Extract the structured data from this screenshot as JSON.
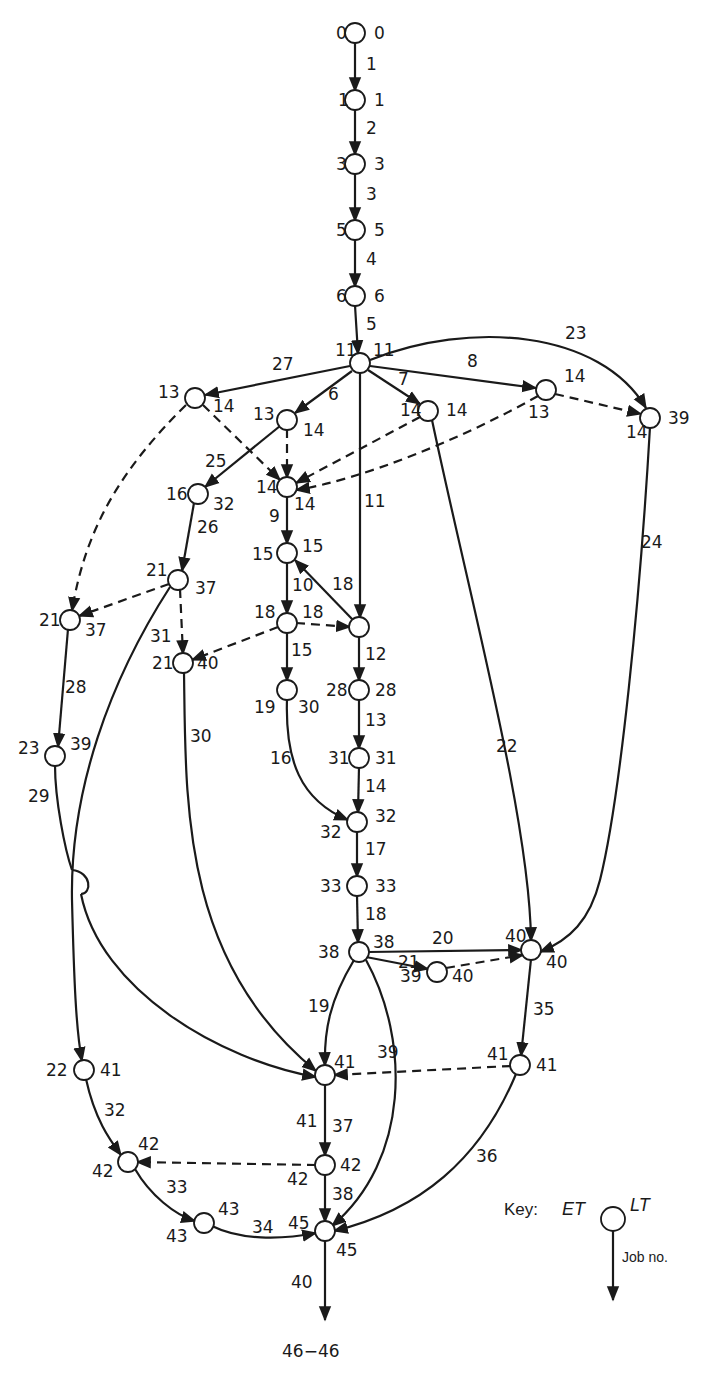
{
  "diagram": {
    "type": "activity-on-arrow network (critical path)",
    "line_color": "#1a1a1a",
    "background": "#ffffff",
    "nodes": [
      {
        "id": "n0",
        "x": 355,
        "y": 33,
        "et": "0",
        "lt": "0",
        "et_pos": [
          336,
          39
        ],
        "lt_pos": [
          374,
          39
        ]
      },
      {
        "id": "n1",
        "x": 355,
        "y": 100,
        "et": "1",
        "lt": "1",
        "et_pos": [
          338,
          106
        ],
        "lt_pos": [
          374,
          106
        ]
      },
      {
        "id": "n3",
        "x": 355,
        "y": 164,
        "et": "3",
        "lt": "3",
        "et_pos": [
          336,
          170
        ],
        "lt_pos": [
          374,
          170
        ]
      },
      {
        "id": "n5",
        "x": 355,
        "y": 230,
        "et": "5",
        "lt": "5",
        "et_pos": [
          336,
          236
        ],
        "lt_pos": [
          374,
          236
        ]
      },
      {
        "id": "n6",
        "x": 355,
        "y": 296,
        "et": "6",
        "lt": "6",
        "et_pos": [
          336,
          302
        ],
        "lt_pos": [
          374,
          302
        ]
      },
      {
        "id": "n11",
        "x": 360,
        "y": 363,
        "et": "11",
        "lt": "11",
        "et_pos": [
          335,
          356
        ],
        "lt_pos": [
          373,
          356
        ]
      },
      {
        "id": "n13a",
        "x": 195,
        "y": 398,
        "et": "13",
        "lt": "14",
        "et_pos": [
          158,
          398
        ],
        "lt_pos": [
          213,
          412
        ]
      },
      {
        "id": "n13b",
        "x": 287,
        "y": 420,
        "et": "13",
        "lt": "14",
        "et_pos": [
          253,
          420
        ],
        "lt_pos": [
          303,
          436
        ]
      },
      {
        "id": "n14c",
        "x": 428,
        "y": 411,
        "et": "14",
        "lt": "14",
        "et_pos": [
          400,
          416
        ],
        "lt_pos": [
          446,
          416
        ]
      },
      {
        "id": "n14d",
        "x": 546,
        "y": 390,
        "et": "13",
        "lt": "14",
        "et_pos": [
          528,
          418
        ],
        "lt_pos": [
          564,
          382
        ]
      },
      {
        "id": "n14e",
        "x": 650,
        "y": 418,
        "et": "14",
        "lt": "39",
        "et_pos": [
          626,
          438
        ],
        "lt_pos": [
          668,
          424
        ]
      },
      {
        "id": "n14f",
        "x": 287,
        "y": 487,
        "et": "14",
        "lt": "14",
        "et_pos": [
          256,
          493
        ],
        "lt_pos": [
          294,
          510
        ]
      },
      {
        "id": "n16",
        "x": 198,
        "y": 494,
        "et": "16",
        "lt": "32",
        "et_pos": [
          166,
          500
        ],
        "lt_pos": [
          213,
          510
        ]
      },
      {
        "id": "n15",
        "x": 287,
        "y": 553,
        "et": "15",
        "lt": "15",
        "et_pos": [
          252,
          560
        ],
        "lt_pos": [
          302,
          552
        ]
      },
      {
        "id": "n21a",
        "x": 178,
        "y": 580,
        "et": "21",
        "lt": "37",
        "et_pos": [
          146,
          576
        ],
        "lt_pos": [
          195,
          594
        ]
      },
      {
        "id": "n18a",
        "x": 287,
        "y": 623,
        "et": "18",
        "lt": "18",
        "et_pos": [
          254,
          618
        ],
        "lt_pos": [
          302,
          618
        ]
      },
      {
        "id": "n18b",
        "x": 359,
        "y": 627,
        "et": "18",
        "lt": "",
        "et_pos": [
          0,
          0
        ],
        "lt_pos": [
          375,
          633
        ]
      },
      {
        "id": "n21b",
        "x": 70,
        "y": 620,
        "et": "21",
        "lt": "37",
        "et_pos": [
          39,
          626
        ],
        "lt_pos": [
          85,
          636
        ]
      },
      {
        "id": "n21c",
        "x": 183,
        "y": 663,
        "et": "21",
        "lt": "40",
        "et_pos": [
          152,
          669
        ],
        "lt_pos": [
          197,
          669
        ]
      },
      {
        "id": "n19",
        "x": 287,
        "y": 690,
        "et": "19",
        "lt": "30",
        "et_pos": [
          254,
          713
        ],
        "lt_pos": [
          298,
          713
        ]
      },
      {
        "id": "n28",
        "x": 359,
        "y": 690,
        "et": "28",
        "lt": "28",
        "et_pos": [
          326,
          696
        ],
        "lt_pos": [
          375,
          696
        ]
      },
      {
        "id": "n23",
        "x": 55,
        "y": 756,
        "et": "23",
        "lt": "39",
        "et_pos": [
          18,
          754
        ],
        "lt_pos": [
          70,
          750
        ]
      },
      {
        "id": "n31",
        "x": 359,
        "y": 758,
        "et": "31",
        "lt": "31",
        "et_pos": [
          328,
          764
        ],
        "lt_pos": [
          375,
          764
        ]
      },
      {
        "id": "n32",
        "x": 357,
        "y": 822,
        "et": "32",
        "lt": "32",
        "et_pos": [
          320,
          838
        ],
        "lt_pos": [
          375,
          822
        ]
      },
      {
        "id": "n33",
        "x": 357,
        "y": 886,
        "et": "33",
        "lt": "33",
        "et_pos": [
          320,
          892
        ],
        "lt_pos": [
          375,
          892
        ]
      },
      {
        "id": "n38",
        "x": 359,
        "y": 952,
        "et": "38",
        "lt": "38",
        "et_pos": [
          318,
          958
        ],
        "lt_pos": [
          373,
          948
        ]
      },
      {
        "id": "n40a",
        "x": 531,
        "y": 950,
        "et": "40",
        "lt": "40",
        "et_pos": [
          505,
          942
        ],
        "lt_pos": [
          546,
          968
        ]
      },
      {
        "id": "n39",
        "x": 437,
        "y": 972,
        "et": "39",
        "lt": "40",
        "et_pos": [
          400,
          982
        ],
        "lt_pos": [
          452,
          982
        ]
      },
      {
        "id": "n41a",
        "x": 520,
        "y": 1065,
        "et": "41",
        "lt": "41",
        "et_pos": [
          487,
          1060
        ],
        "lt_pos": [
          536,
          1071
        ]
      },
      {
        "id": "n22",
        "x": 84,
        "y": 1070,
        "et": "22",
        "lt": "41",
        "et_pos": [
          46,
          1076
        ],
        "lt_pos": [
          100,
          1076
        ]
      },
      {
        "id": "n41b",
        "x": 325,
        "y": 1075,
        "et": "41",
        "lt": "41",
        "et_pos": [
          296,
          1127
        ],
        "lt_pos": [
          334,
          1068
        ]
      },
      {
        "id": "n42a",
        "x": 128,
        "y": 1162,
        "et": "42",
        "lt": "42",
        "et_pos": [
          92,
          1177
        ],
        "lt_pos": [
          138,
          1150
        ]
      },
      {
        "id": "n42b",
        "x": 325,
        "y": 1165,
        "et": "42",
        "lt": "42",
        "et_pos": [
          287,
          1185
        ],
        "lt_pos": [
          340,
          1171
        ]
      },
      {
        "id": "n43",
        "x": 204,
        "y": 1223,
        "et": "43",
        "lt": "43",
        "et_pos": [
          166,
          1242
        ],
        "lt_pos": [
          218,
          1215
        ]
      },
      {
        "id": "n45",
        "x": 325,
        "y": 1231,
        "et": "45",
        "lt": "45",
        "et_pos": [
          288,
          1229
        ],
        "lt_pos": [
          336,
          1256
        ]
      }
    ],
    "edges": [
      {
        "job": "1",
        "d": "M355,42 L355,91",
        "dashed": false,
        "label_pos": [
          366,
          70
        ]
      },
      {
        "job": "2",
        "d": "M355,109 L355,155",
        "dashed": false,
        "label_pos": [
          366,
          134
        ]
      },
      {
        "job": "3",
        "d": "M355,173 L355,221",
        "dashed": false,
        "label_pos": [
          366,
          200
        ]
      },
      {
        "job": "4",
        "d": "M355,239 L355,287",
        "dashed": false,
        "label_pos": [
          366,
          265
        ]
      },
      {
        "job": "5",
        "d": "M355,305 L358,354",
        "dashed": false,
        "label_pos": [
          366,
          330
        ]
      },
      {
        "job": "27",
        "d": "M350,366 L205,395",
        "dashed": false,
        "label_pos": [
          272,
          370
        ]
      },
      {
        "job": "6",
        "d": "M352,371 L295,413",
        "dashed": false,
        "label_pos": [
          328,
          400
        ]
      },
      {
        "job": "7",
        "d": "M368,370 L420,404",
        "dashed": false,
        "label_pos": [
          398,
          385
        ]
      },
      {
        "job": "8",
        "d": "M370,366 L536,388",
        "dashed": false,
        "label_pos": [
          467,
          367
        ]
      },
      {
        "job": "23",
        "d": "M370,360 C470,320 600,330 646,408",
        "dashed": false,
        "label_pos": [
          565,
          339
        ]
      },
      {
        "job": "11",
        "d": "M360,373 L360,618",
        "dashed": false,
        "label_pos": [
          364,
          507
        ]
      },
      {
        "job": "",
        "d": "M203,405 L280,480",
        "dashed": true,
        "label_pos": [
          0,
          0
        ]
      },
      {
        "job": "",
        "d": "M287,429 L287,478",
        "dashed": true,
        "label_pos": [
          0,
          0
        ]
      },
      {
        "job": "",
        "d": "M420,417 L296,483",
        "dashed": true,
        "label_pos": [
          0,
          0
        ]
      },
      {
        "job": "",
        "d": "M538,396 C460,440 360,480 296,490",
        "dashed": true,
        "label_pos": [
          0,
          0
        ]
      },
      {
        "job": "",
        "d": "M555,394 L641,414",
        "dashed": true,
        "label_pos": [
          0,
          0
        ]
      },
      {
        "job": "",
        "d": "M186,405 C120,470 85,530 72,611",
        "dashed": true,
        "label_pos": [
          0,
          0
        ]
      },
      {
        "job": "25",
        "d": "M280,426 L205,487",
        "dashed": false,
        "label_pos": [
          205,
          467
        ]
      },
      {
        "job": "26",
        "d": "M194,503 L182,571",
        "dashed": false,
        "label_pos": [
          197,
          533
        ]
      },
      {
        "job": "9",
        "d": "M287,496 L287,544",
        "dashed": false,
        "label_pos": [
          269,
          522
        ]
      },
      {
        "job": "10",
        "d": "M287,562 L287,614",
        "dashed": false,
        "label_pos": [
          292,
          591
        ]
      },
      {
        "job": "18",
        "d": "M353,620 L295,560",
        "dashed": false,
        "label_pos": [
          332,
          590
        ]
      },
      {
        "job": "",
        "d": "M296,623 L350,627",
        "dashed": true,
        "label_pos": [
          0,
          0
        ]
      },
      {
        "job": "",
        "d": "M169,584 L79,616",
        "dashed": true,
        "label_pos": [
          0,
          0
        ]
      },
      {
        "job": "",
        "d": "M180,589 L183,654",
        "dashed": true,
        "label_pos": [
          0,
          0
        ]
      },
      {
        "job": "",
        "d": "M278,627 L192,660",
        "dashed": true,
        "label_pos": [
          0,
          0
        ]
      },
      {
        "job": "15",
        "d": "M287,632 L287,681",
        "dashed": false,
        "label_pos": [
          291,
          656
        ]
      },
      {
        "job": "12",
        "d": "M359,636 L359,681",
        "dashed": false,
        "label_pos": [
          365,
          660
        ]
      },
      {
        "job": "13",
        "d": "M359,699 L359,749",
        "dashed": false,
        "label_pos": [
          365,
          726
        ]
      },
      {
        "job": "14",
        "d": "M359,767 L358,813",
        "dashed": false,
        "label_pos": [
          365,
          792
        ]
      },
      {
        "job": "16",
        "d": "M287,699 C285,760 300,800 348,820",
        "dashed": false,
        "label_pos": [
          270,
          764
        ]
      },
      {
        "job": "17",
        "d": "M357,831 L357,877",
        "dashed": false,
        "label_pos": [
          365,
          855
        ]
      },
      {
        "job": "18",
        "d": "M357,895 L358,943",
        "dashed": false,
        "label_pos": [
          365,
          920
        ]
      },
      {
        "job": "28",
        "d": "M68,629 L58,747",
        "dashed": false,
        "label_pos": [
          65,
          693
        ]
      },
      {
        "job": "29",
        "d": "M55,765 C55,800 65,850 72,870 M81,894 C100,990 220,1060 316,1077",
        "dashed": false,
        "label_pos": [
          28,
          802
        ]
      },
      {
        "job": "hop",
        "d": "M72,870 C92,872 92,894 81,894",
        "dashed": false,
        "label_pos": [
          0,
          0
        ]
      },
      {
        "job": "31",
        "d": "M170,587 C110,680 70,790 72,900 C74,980 76,1030 82,1061",
        "dashed": false,
        "label_pos": [
          150,
          642
        ]
      },
      {
        "job": "30",
        "d": "M184,672 C186,800 180,960 316,1071",
        "dashed": false,
        "label_pos": [
          190,
          742
        ]
      },
      {
        "job": "22",
        "d": "M432,420 C470,600 530,820 531,941",
        "dashed": false,
        "label_pos": [
          496,
          752
        ]
      },
      {
        "job": "24",
        "d": "M650,427 C640,600 620,800 600,880 C590,920 570,940 540,952",
        "dashed": false,
        "label_pos": [
          641,
          548
        ]
      },
      {
        "job": "20",
        "d": "M368,952 L522,950",
        "dashed": false,
        "label_pos": [
          432,
          944
        ]
      },
      {
        "job": "21",
        "d": "M366,957 L428,969",
        "dashed": false,
        "label_pos": [
          398,
          968
        ]
      },
      {
        "job": "",
        "d": "M446,968 L523,955",
        "dashed": true,
        "label_pos": [
          0,
          0
        ]
      },
      {
        "job": "19",
        "d": "M354,960 C330,1000 324,1030 325,1066",
        "dashed": false,
        "label_pos": [
          308,
          1012
        ]
      },
      {
        "job": "39",
        "d": "M366,960 C410,1040 410,1160 332,1226",
        "dashed": false,
        "label_pos": [
          377,
          1058
        ]
      },
      {
        "job": "35",
        "d": "M531,959 L521,1056",
        "dashed": false,
        "label_pos": [
          533,
          1015
        ]
      },
      {
        "job": "",
        "d": "M511,1066 L334,1075",
        "dashed": true,
        "label_pos": [
          0,
          0
        ]
      },
      {
        "job": "36",
        "d": "M516,1074 C480,1160 420,1210 334,1231",
        "dashed": false,
        "label_pos": [
          476,
          1162
        ]
      },
      {
        "job": "37",
        "d": "M325,1084 L325,1156",
        "dashed": false,
        "label_pos": [
          332,
          1132
        ]
      },
      {
        "job": "",
        "d": "M316,1165 L137,1162",
        "dashed": true,
        "label_pos": [
          0,
          0
        ]
      },
      {
        "job": "32",
        "d": "M86,1079 C95,1120 110,1140 121,1155",
        "dashed": false,
        "label_pos": [
          104,
          1116
        ]
      },
      {
        "job": "33",
        "d": "M135,1169 C150,1195 175,1215 195,1221",
        "dashed": false,
        "label_pos": [
          166,
          1193
        ]
      },
      {
        "job": "34",
        "d": "M212,1226 C240,1240 280,1240 316,1233",
        "dashed": false,
        "label_pos": [
          252,
          1233
        ]
      },
      {
        "job": "38",
        "d": "M325,1174 L325,1222",
        "dashed": false,
        "label_pos": [
          332,
          1200
        ]
      },
      {
        "job": "40",
        "d": "M325,1240 L325,1320",
        "dashed": false,
        "label_pos": [
          291,
          1288
        ]
      }
    ],
    "end_label": {
      "text": "46−46",
      "pos": [
        282,
        1357
      ]
    }
  },
  "key": {
    "title": "Key:",
    "et": "ET",
    "lt": "LT",
    "job": "Job no."
  }
}
